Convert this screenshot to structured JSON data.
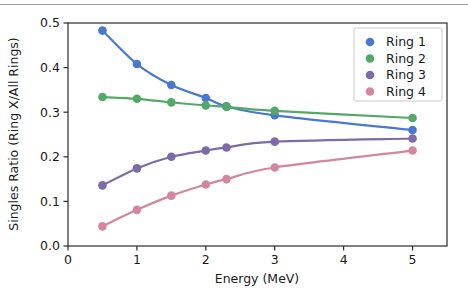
{
  "chart_data": {
    "type": "line",
    "title": "",
    "xlabel": "Energy (MeV)",
    "ylabel": "Singles Ratio (Ring X/All Rings)",
    "xlim": [
      0,
      5.5
    ],
    "ylim": [
      0.0,
      0.5
    ],
    "grid": false,
    "legend_position": "upper right",
    "xticks": [
      "0",
      "1",
      "2",
      "3",
      "4",
      "5"
    ],
    "xtick_values": [
      0,
      1,
      2,
      3,
      4,
      5
    ],
    "yticks": [
      "0.0",
      "0.1",
      "0.2",
      "0.3",
      "0.4",
      "0.5"
    ],
    "ytick_values": [
      0.0,
      0.1,
      0.2,
      0.3,
      0.4,
      0.5
    ],
    "x": [
      0.5,
      1.0,
      1.5,
      2.0,
      2.3,
      3.0,
      5.0
    ],
    "series": [
      {
        "name": "Ring 1",
        "color": "#4878cf",
        "values": [
          0.483,
          0.408,
          0.361,
          0.332,
          0.313,
          0.293,
          0.26
        ]
      },
      {
        "name": "Ring 2",
        "color": "#55a868",
        "values": [
          0.334,
          0.33,
          0.322,
          0.315,
          0.312,
          0.303,
          0.287
        ]
      },
      {
        "name": "Ring 3",
        "color": "#7d6ba8",
        "values": [
          0.136,
          0.174,
          0.2,
          0.214,
          0.221,
          0.234,
          0.241
        ]
      },
      {
        "name": "Ring 4",
        "color": "#d2879f",
        "values": [
          0.044,
          0.081,
          0.113,
          0.138,
          0.15,
          0.176,
          0.214
        ]
      }
    ]
  }
}
